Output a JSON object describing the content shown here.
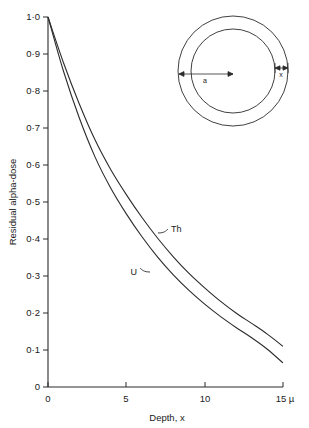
{
  "chart_data": {
    "type": "line",
    "title": "",
    "xlabel": "Depth, x",
    "ylabel": "Residual alpha-dose",
    "xlim": [
      0,
      15
    ],
    "ylim": [
      0,
      1.0
    ],
    "grid": false,
    "legend_position": "inline-curve-labels",
    "x_unit": "µ",
    "x_ticks": [
      {
        "value": 0,
        "label": "0"
      },
      {
        "value": 5,
        "label": "5"
      },
      {
        "value": 10,
        "label": "10"
      },
      {
        "value": 15,
        "label": "15 µ"
      }
    ],
    "y_ticks": [
      {
        "value": 0,
        "label": "0"
      },
      {
        "value": 0.1,
        "label": "0·1"
      },
      {
        "value": 0.2,
        "label": "0·2"
      },
      {
        "value": 0.3,
        "label": "0·3"
      },
      {
        "value": 0.4,
        "label": "0·4"
      },
      {
        "value": 0.5,
        "label": "0·5"
      },
      {
        "value": 0.6,
        "label": "0·6"
      },
      {
        "value": 0.7,
        "label": "0·7"
      },
      {
        "value": 0.8,
        "label": "0·8"
      },
      {
        "value": 0.9,
        "label": "0·9"
      },
      {
        "value": 1.0,
        "label": "1·0"
      }
    ],
    "x": [
      0,
      1,
      2,
      3,
      4,
      5,
      6,
      7,
      8,
      9,
      10,
      11,
      12,
      13,
      14,
      15
    ],
    "series": [
      {
        "name": "Th",
        "label": "Th",
        "values": [
          1.0,
          0.875,
          0.765,
          0.668,
          0.588,
          0.52,
          0.458,
          0.402,
          0.352,
          0.307,
          0.268,
          0.232,
          0.2,
          0.172,
          0.143,
          0.11
        ]
      },
      {
        "name": "U",
        "label": "U",
        "values": [
          1.0,
          0.852,
          0.727,
          0.622,
          0.538,
          0.468,
          0.406,
          0.351,
          0.303,
          0.261,
          0.224,
          0.191,
          0.161,
          0.133,
          0.102,
          0.065
        ]
      }
    ]
  },
  "inset": {
    "name": "concentric-shell-diagram",
    "radius_label": "a",
    "thickness_label": "x"
  }
}
